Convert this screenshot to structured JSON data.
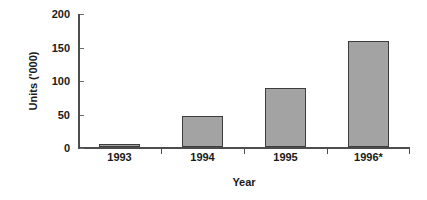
{
  "chart_data": {
    "type": "bar",
    "title": "",
    "subtitle": "",
    "xlabel": "Year",
    "ylabel": "Units ('000)",
    "categories": [
      "1993",
      "1994",
      "1995",
      "1996*"
    ],
    "values": [
      5,
      47,
      88,
      158
    ],
    "series": [
      {
        "name": "Units",
        "values": [
          5,
          47,
          88,
          158
        ]
      }
    ],
    "ylim": [
      0,
      200
    ],
    "y_ticks": [
      0,
      50,
      100,
      150,
      200
    ],
    "y_tick_labels": [
      "0",
      "50",
      "100",
      "150",
      "200"
    ],
    "grid": false,
    "legend": false,
    "legend_position": "none",
    "bar_fill_color": "#a3a3a3",
    "bar_edge_color": "#3d3d3d",
    "axis_color": "#4d4d4d",
    "text_color": "#1a1a1a",
    "background_color": "#ffffff",
    "annotations": [
      "* denotes estimated or provisional figure"
    ]
  }
}
